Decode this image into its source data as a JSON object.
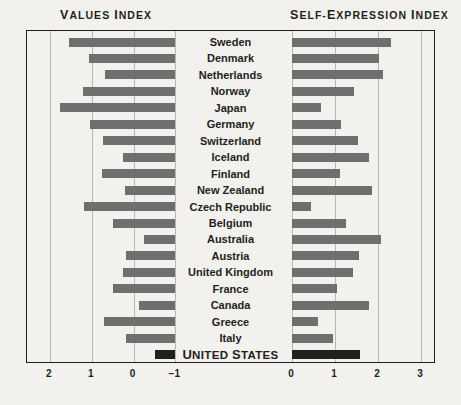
{
  "headers": {
    "left": "Values Index",
    "right": "Self-Expression Index"
  },
  "chart_data": {
    "type": "bar",
    "title": "",
    "orientation": "horizontal",
    "layout": "diverging-paired-panels",
    "grid": true,
    "legend": null,
    "panels": [
      {
        "name": "values_index",
        "label": "Values Index",
        "side": "left",
        "axis_direction": "descending-left-to-right",
        "ticks": [
          2,
          1,
          0,
          -1
        ],
        "tick_labels": [
          "2",
          "1",
          "0",
          "−1"
        ],
        "xlim": [
          2.0,
          -1.0
        ],
        "anchor": "right-edge-at--1"
      },
      {
        "name": "self_expression_index",
        "label": "Self-Expression Index",
        "side": "right",
        "axis_direction": "ascending-left-to-right",
        "ticks": [
          0,
          1,
          2,
          3
        ],
        "tick_labels": [
          "0",
          "1",
          "2",
          "3"
        ],
        "xlim": [
          0.0,
          3.0
        ],
        "anchor": "left-edge-at-0"
      }
    ],
    "categories": [
      "Sweden",
      "Denmark",
      "Netherlands",
      "Norway",
      "Japan",
      "Germany",
      "Switzerland",
      "Iceland",
      "Finland",
      "New Zealand",
      "Czech Republic",
      "Belgium",
      "Australia",
      "Austria",
      "United Kingdom",
      "France",
      "Canada",
      "Greece",
      "Italy",
      "United States"
    ],
    "series": [
      {
        "name": "Values Index",
        "panel": "values_index",
        "values": [
          1.55,
          1.07,
          0.69,
          1.21,
          1.76,
          1.05,
          0.74,
          0.24,
          0.76,
          0.2,
          1.19,
          0.48,
          -0.24,
          0.17,
          0.26,
          0.48,
          -0.14,
          0.71,
          0.17,
          -0.52
        ]
      },
      {
        "name": "Self-Expression Index",
        "panel": "self_expression_index",
        "values": [
          2.3,
          2.02,
          2.11,
          1.44,
          0.67,
          1.14,
          1.53,
          1.79,
          1.12,
          1.86,
          0.44,
          1.26,
          2.07,
          1.56,
          1.42,
          1.05,
          1.8,
          0.6,
          0.96,
          1.59
        ]
      }
    ],
    "highlight": {
      "category": "United States",
      "index": 19,
      "style": "dark-bars-bold-smallcaps-label"
    },
    "colors": {
      "bar": "#6f6f6f",
      "bar_highlight": "#221f1f",
      "background": "#f2f1ee",
      "frame": "#231f20",
      "gridline": "#b9b7b1",
      "text": "#231f20"
    }
  }
}
